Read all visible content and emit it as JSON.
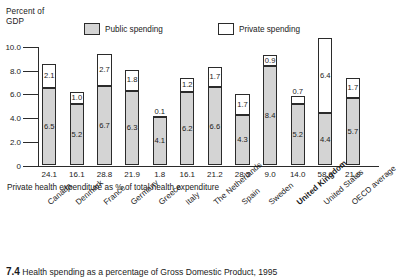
{
  "chart_data": {
    "type": "bar",
    "title": "",
    "axis_title": "Percent of\nGDP",
    "ylabel": "Percent of GDP",
    "xlabel": "",
    "subtitle": "Private health expenditure as % of total health expenditure",
    "ylim": [
      0,
      10.0
    ],
    "yticks": [
      "0",
      "2.0",
      "4.0",
      "6.0",
      "8.0",
      "10.0"
    ],
    "ytick_values": [
      0,
      2.0,
      4.0,
      6.0,
      8.0,
      10.0
    ],
    "grid": false,
    "stacked": true,
    "legend_position": "top",
    "legend": [
      "Public spending",
      "Private spending"
    ],
    "categories": [
      "Canada",
      "Denmark",
      "France",
      "Germany",
      "Greece",
      "Italy",
      "The Netherlands",
      "Spain",
      "Sweden",
      "United Kingdom",
      "United States",
      "OECD average"
    ],
    "bold_categories": [
      "United Kingdom"
    ],
    "series": [
      {
        "name": "Public spending",
        "values": [
          6.5,
          5.2,
          6.7,
          6.3,
          4.1,
          6.2,
          6.6,
          4.3,
          8.4,
          5.2,
          4.4,
          5.7
        ]
      },
      {
        "name": "Private spending",
        "values": [
          2.1,
          1.0,
          2.7,
          1.8,
          0.1,
          1.2,
          1.7,
          1.7,
          0.9,
          0.7,
          6.4,
          1.7
        ]
      }
    ],
    "private_share_row_label": "Private health expenditure as % of total health expenditure",
    "private_share_values": [
      "24.1",
      "16.1",
      "28.8",
      "21.9",
      "1.8",
      "16.1",
      "21.2",
      "28.5",
      "9.0",
      "14.0",
      "58.9",
      "21.9"
    ]
  },
  "legend": {
    "public_label": "Public spending",
    "private_label": "Private spending"
  },
  "caption": {
    "number": "7.4",
    "text": "Health spending as a percentage of Gross Domestic Product, 1995"
  },
  "colors": {
    "public_fill": "#d4d4d4",
    "private_fill": "#ffffff",
    "stroke": "#2b2b2b",
    "text": "#1a1a1a"
  }
}
